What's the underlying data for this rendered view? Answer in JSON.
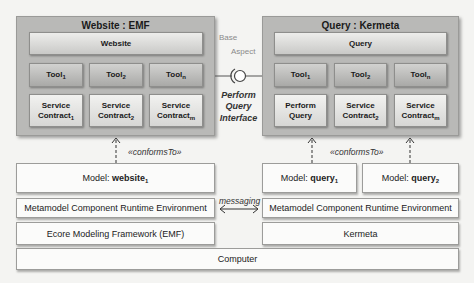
{
  "left_component": {
    "title": "Website : EMF",
    "top": "Website",
    "tools": [
      {
        "name": "Tool",
        "sub": "1"
      },
      {
        "name": "Tool",
        "sub": "2"
      },
      {
        "name": "Tool",
        "sub": "n"
      }
    ],
    "services": [
      {
        "line1": "Service",
        "name": "Contract",
        "sub": "1"
      },
      {
        "line1": "Service",
        "name": "Contract",
        "sub": "2"
      },
      {
        "line1": "Service",
        "name": "Contract",
        "sub": "m"
      }
    ]
  },
  "right_component": {
    "title": "Query : Kermeta",
    "top": "Query",
    "tools": [
      {
        "name": "Tool",
        "sub": "1"
      },
      {
        "name": "Tool",
        "sub": "2"
      },
      {
        "name": "Tool",
        "sub": "n"
      }
    ],
    "services": [
      {
        "line1": "Perform",
        "name": "Query",
        "sub": ""
      },
      {
        "line1": "Service",
        "name": "Contract",
        "sub": "2"
      },
      {
        "line1": "Service",
        "name": "Contract",
        "sub": "m"
      }
    ]
  },
  "interface": {
    "base_label": "Base",
    "aspect_label": "Aspect",
    "name_line1": "Perform",
    "name_line2": "Query",
    "name_line3": "Interface"
  },
  "relations": {
    "conforms_left": "«conformsTo»",
    "conforms_right": "«conformsTo»",
    "messaging": "messaging"
  },
  "left_stack": {
    "model_prefix": "Model: ",
    "model_name": "website",
    "model_sub": "1",
    "runtime": "Metamodel Component Runtime Environment",
    "framework": "Ecore Modeling Framework (EMF)"
  },
  "right_stack": {
    "model1_prefix": "Model: ",
    "model1_name": "query",
    "model1_sub": "1",
    "model2_prefix": "Model: ",
    "model2_name": "query",
    "model2_sub": "2",
    "runtime": "Metamodel Component Runtime Environment",
    "framework": "Kermeta"
  },
  "base": {
    "computer": "Computer"
  }
}
